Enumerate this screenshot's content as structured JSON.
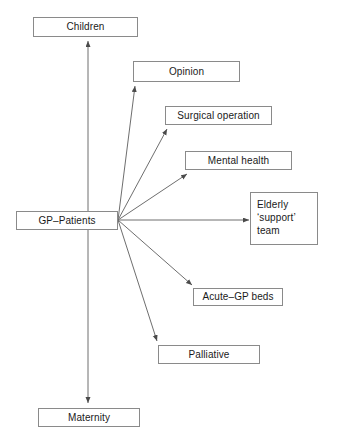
{
  "diagram": {
    "type": "flow-diagram",
    "center": {
      "id": "gp-patients",
      "label": "GP–Patients"
    },
    "nodes": [
      {
        "id": "children",
        "label": "Children"
      },
      {
        "id": "opinion",
        "label": "Opinion"
      },
      {
        "id": "surgical-operation",
        "label": "Surgical operation"
      },
      {
        "id": "mental-health",
        "label": "Mental health"
      },
      {
        "id": "elderly-support-team",
        "label": "Elderly\n‘support’\nteam"
      },
      {
        "id": "acute-gp-beds",
        "label": "Acute–GP beds"
      },
      {
        "id": "palliative",
        "label": "Palliative"
      },
      {
        "id": "maternity",
        "label": "Maternity"
      }
    ],
    "edges": [
      {
        "from": "gp-patients",
        "to": "children"
      },
      {
        "from": "gp-patients",
        "to": "opinion"
      },
      {
        "from": "gp-patients",
        "to": "surgical-operation"
      },
      {
        "from": "gp-patients",
        "to": "mental-health"
      },
      {
        "from": "gp-patients",
        "to": "elderly-support-team"
      },
      {
        "from": "gp-patients",
        "to": "acute-gp-beds"
      },
      {
        "from": "gp-patients",
        "to": "palliative"
      },
      {
        "from": "gp-patients",
        "to": "maternity"
      }
    ],
    "colors": {
      "background": "#ffffff",
      "node_border": "#8a8a8a",
      "edge": "#6e6e6e",
      "text": "#1a1a1a"
    }
  }
}
